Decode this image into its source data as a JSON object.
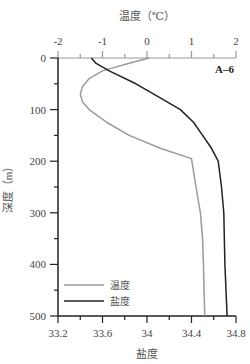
{
  "chart_data": {
    "type": "line",
    "title": "",
    "panel_label": "A–6",
    "top_axis": {
      "label": "温度（℃）",
      "ticks": [
        "-2",
        "-1",
        "0",
        "1",
        "2"
      ],
      "range": [
        -2,
        2
      ]
    },
    "bottom_axis": {
      "label": "盐度",
      "ticks": [
        "33.2",
        "33.6",
        "34",
        "34.4",
        "34.8"
      ],
      "range": [
        33.2,
        34.8
      ]
    },
    "y_axis": {
      "label": "深度（m）",
      "ticks": [
        "0",
        "100",
        "200",
        "300",
        "400",
        "500"
      ],
      "range": [
        0,
        500
      ],
      "inverted": true
    },
    "legend": {
      "position": "lower-left",
      "entries": [
        "温度",
        "盐度"
      ]
    },
    "series": [
      {
        "name": "温度",
        "color": "#9a9a9a",
        "axis": "top",
        "depth": [
          0,
          10,
          25,
          40,
          55,
          70,
          85,
          100,
          125,
          150,
          175,
          195,
          250,
          300,
          350,
          400,
          450,
          500
        ],
        "values": [
          0.05,
          -0.4,
          -1.0,
          -1.3,
          -1.45,
          -1.5,
          -1.45,
          -1.3,
          -0.9,
          -0.4,
          0.3,
          1.0,
          1.1,
          1.2,
          1.25,
          1.27,
          1.28,
          1.3
        ]
      },
      {
        "name": "盐度",
        "color": "#222222",
        "axis": "bottom",
        "depth": [
          0,
          10,
          25,
          50,
          75,
          100,
          125,
          150,
          175,
          200,
          250,
          300,
          400,
          500
        ],
        "values": [
          33.5,
          33.54,
          33.66,
          33.9,
          34.1,
          34.3,
          34.42,
          34.5,
          34.58,
          34.64,
          34.67,
          34.69,
          34.7,
          34.72
        ]
      }
    ]
  }
}
